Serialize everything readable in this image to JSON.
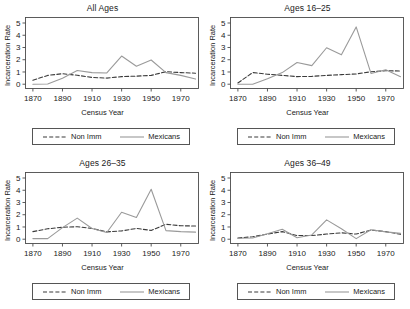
{
  "figure": {
    "layout": "2x2 grid of line panels",
    "shared_xlabel": "Census Year",
    "shared_ylabel": "Incarceration Rate"
  },
  "legend": {
    "non_imm_label": "Non Imm",
    "mexicans_label": "Mexicans",
    "non_imm_style": "dashed",
    "mexicans_style": "solid",
    "non_imm_color": "#3a3a3a",
    "mexicans_color": "#9a9a9a"
  },
  "axes": {
    "x_ticks": [
      1870,
      1890,
      1910,
      1930,
      1950,
      1970
    ],
    "x_tick_labels": [
      "1870",
      "1890",
      "1910",
      "1930",
      "1950",
      "1970"
    ],
    "y_ticks": [
      0,
      1,
      2,
      3,
      4,
      5
    ],
    "y_tick_labels": [
      "0",
      "1",
      "2",
      "3",
      "4",
      "5"
    ],
    "xlim": [
      1865,
      1982
    ],
    "ylim": [
      -0.35,
      5.45
    ],
    "grid": false
  },
  "chart_data": [
    {
      "type": "line",
      "title": "All Ages",
      "xlabel": "Census Year",
      "ylabel": "Incarceration Rate",
      "xlim": [
        1865,
        1982
      ],
      "ylim": [
        -0.35,
        5.45
      ],
      "grid": false,
      "legend_position": "below",
      "x": [
        1870,
        1880,
        1890,
        1900,
        1910,
        1920,
        1930,
        1940,
        1950,
        1960,
        1970,
        1980
      ],
      "series": [
        {
          "name": "Non Imm",
          "style": "dashed",
          "color": "#3a3a3a",
          "values": [
            0.32,
            0.72,
            0.86,
            0.73,
            0.55,
            0.5,
            0.62,
            0.66,
            0.72,
            1.02,
            0.95,
            0.9
          ]
        },
        {
          "name": "Mexicans",
          "style": "solid",
          "color": "#9a9a9a",
          "values": [
            0.0,
            0.02,
            0.48,
            1.12,
            0.95,
            0.92,
            2.3,
            1.47,
            1.98,
            0.95,
            0.72,
            0.42
          ]
        }
      ]
    },
    {
      "type": "line",
      "title": "Ages 16–25",
      "xlabel": "Census Year",
      "ylabel": "Incarceration Rate",
      "xlim": [
        1865,
        1982
      ],
      "ylim": [
        -0.35,
        5.45
      ],
      "grid": false,
      "legend_position": "below",
      "x": [
        1870,
        1880,
        1890,
        1900,
        1910,
        1920,
        1930,
        1940,
        1950,
        1960,
        1970,
        1980
      ],
      "series": [
        {
          "name": "Non Imm",
          "style": "dashed",
          "color": "#3a3a3a",
          "values": [
            0.1,
            0.95,
            0.82,
            0.72,
            0.62,
            0.64,
            0.72,
            0.78,
            0.84,
            1.02,
            1.1,
            1.08
          ]
        },
        {
          "name": "Mexicans",
          "style": "solid",
          "color": "#9a9a9a",
          "values": [
            0.0,
            0.0,
            0.45,
            0.95,
            1.78,
            1.52,
            2.98,
            2.4,
            4.68,
            0.88,
            1.18,
            0.62
          ]
        }
      ]
    },
    {
      "type": "line",
      "title": "Ages 26–35",
      "xlabel": "Census Year",
      "ylabel": "Incarceration Rate",
      "xlim": [
        1865,
        1982
      ],
      "ylim": [
        -0.35,
        5.45
      ],
      "grid": false,
      "legend_position": "below",
      "x": [
        1870,
        1880,
        1890,
        1900,
        1910,
        1920,
        1930,
        1940,
        1950,
        1960,
        1970,
        1980
      ],
      "series": [
        {
          "name": "Non Imm",
          "style": "dashed",
          "color": "#3a3a3a",
          "values": [
            0.62,
            0.85,
            0.98,
            1.02,
            0.88,
            0.6,
            0.68,
            0.88,
            0.72,
            1.22,
            1.1,
            1.08
          ]
        },
        {
          "name": "Mexicans",
          "style": "solid",
          "color": "#9a9a9a",
          "values": [
            0.05,
            0.05,
            0.95,
            1.72,
            0.88,
            0.55,
            2.2,
            1.78,
            4.08,
            0.7,
            0.62,
            0.58
          ]
        }
      ]
    },
    {
      "type": "line",
      "title": "Ages 36–49",
      "xlabel": "Census Year",
      "ylabel": "Incarceration Rate",
      "xlim": [
        1865,
        1982
      ],
      "ylim": [
        -0.35,
        5.45
      ],
      "grid": false,
      "legend_position": "below",
      "x": [
        1870,
        1880,
        1890,
        1900,
        1910,
        1920,
        1930,
        1940,
        1950,
        1960,
        1970,
        1980
      ],
      "series": [
        {
          "name": "Non Imm",
          "style": "dashed",
          "color": "#3a3a3a",
          "values": [
            0.1,
            0.2,
            0.42,
            0.62,
            0.3,
            0.3,
            0.42,
            0.52,
            0.42,
            0.75,
            0.62,
            0.4
          ]
        },
        {
          "name": "Mexicans",
          "style": "solid",
          "color": "#9a9a9a",
          "values": [
            0.08,
            0.1,
            0.45,
            0.82,
            0.12,
            0.35,
            1.58,
            0.85,
            0.05,
            0.78,
            0.6,
            0.48
          ]
        }
      ]
    }
  ]
}
